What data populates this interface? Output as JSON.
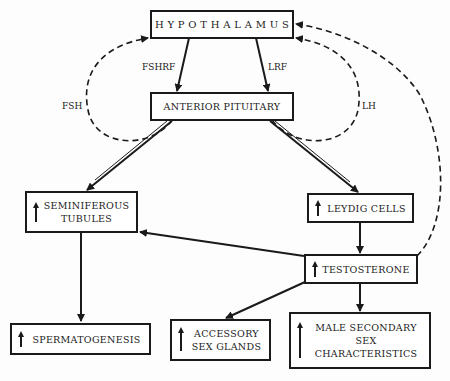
{
  "nodes": {
    "hypothalamus": "H Y P O T H A L A M U S",
    "anterior_pituitary": "ANTERIOR PITUITARY",
    "seminiferous_tubules_1": "SEMINIFEROUS",
    "seminiferous_tubules_2": "TUBULES",
    "leydig_cells": "LEYDIG CELLS",
    "testosterone": "TESTOSTERONE",
    "spermatogenesis": "SPERMATOGENESIS",
    "accessory_1": "ACCESSORY",
    "accessory_2": "SEX GLANDS",
    "male_secondary_1": "MALE SECONDARY",
    "male_secondary_2": "SEX",
    "male_secondary_3": "CHARACTERISTICS"
  },
  "edges": {
    "fshrf": "FSHRF",
    "lrf": "LRF",
    "fsh": "FSH",
    "lh": "LH"
  },
  "indicators": {
    "increase_symbol": "up-arrow"
  }
}
